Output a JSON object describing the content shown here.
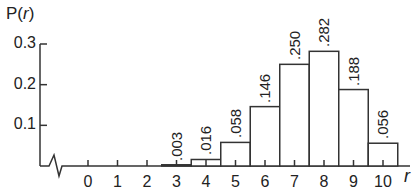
{
  "chart_data": {
    "type": "bar",
    "title": "",
    "xlabel": "r",
    "ylabel": "P(r)",
    "categories": [
      "0",
      "1",
      "2",
      "3",
      "4",
      "5",
      "6",
      "7",
      "8",
      "9",
      "10"
    ],
    "values": [
      0,
      0,
      0,
      0.003,
      0.016,
      0.058,
      0.146,
      0.25,
      0.282,
      0.188,
      0.056
    ],
    "bar_labels": [
      "",
      "",
      "",
      ".003",
      ".016",
      ".058",
      ".146",
      ".250",
      ".282",
      ".188",
      ".056"
    ],
    "y_ticks": [
      0.1,
      0.2,
      0.3
    ],
    "y_tick_labels": [
      "0.1",
      "0.2",
      "0.3"
    ],
    "ylim": [
      0,
      0.3
    ],
    "grid": false,
    "legend": null,
    "axis_break": true
  },
  "labels": {
    "ylabel_main": "P(",
    "ylabel_var": "r",
    "ylabel_close": ")",
    "xlabel": "r"
  }
}
